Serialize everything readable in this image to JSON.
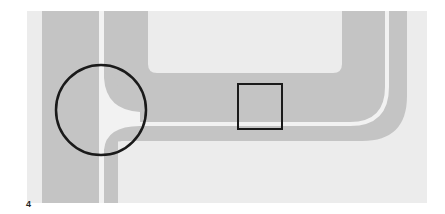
{
  "figure": {
    "label": "4",
    "colors": {
      "background": "#ececec",
      "road": "#c4c4c4",
      "line": "#f2f2f2",
      "marker": "#1a1a1a"
    },
    "markers": [
      {
        "type": "circle",
        "name": "junction-highlight"
      },
      {
        "type": "square",
        "name": "section-highlight"
      }
    ]
  }
}
